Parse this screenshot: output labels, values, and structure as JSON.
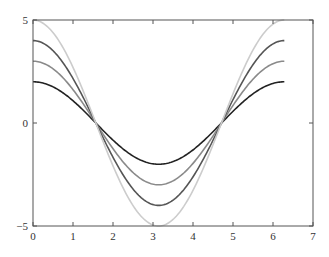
{
  "chart_data": {
    "type": "line",
    "title": "",
    "xlabel": "",
    "ylabel": "",
    "xlim": [
      0,
      7
    ],
    "ylim": [
      -5,
      5
    ],
    "grid": false,
    "legend": null,
    "x_ticks": [
      "0",
      "1",
      "2",
      "3",
      "4",
      "5",
      "6",
      "7"
    ],
    "y_ticks": [
      "−5",
      "0",
      "5"
    ],
    "x_domain": [
      0,
      6.2832
    ],
    "series": [
      {
        "name": "2cos(x)",
        "amplitude": 2,
        "color": "#222222",
        "function": "2*cos(x)",
        "x": [
          0,
          1.5708,
          3.1416,
          4.7124,
          6.2832
        ],
        "values": [
          2,
          0,
          -2,
          0,
          2
        ]
      },
      {
        "name": "3cos(x)",
        "amplitude": 3,
        "color": "#8a8a8a",
        "function": "3*cos(x)",
        "x": [
          0,
          1.5708,
          3.1416,
          4.7124,
          6.2832
        ],
        "values": [
          3,
          0,
          -3,
          0,
          3
        ]
      },
      {
        "name": "4cos(x)",
        "amplitude": 4,
        "color": "#555555",
        "function": "4*cos(x)",
        "x": [
          0,
          1.5708,
          3.1416,
          4.7124,
          6.2832
        ],
        "values": [
          4,
          0,
          -4,
          0,
          4
        ]
      },
      {
        "name": "5cos(x)",
        "amplitude": 5,
        "color": "#cccccc",
        "function": "5*cos(x)",
        "x": [
          0,
          1.5708,
          3.1416,
          4.7124,
          6.2832
        ],
        "values": [
          5,
          0,
          -5,
          0,
          5
        ]
      }
    ]
  }
}
